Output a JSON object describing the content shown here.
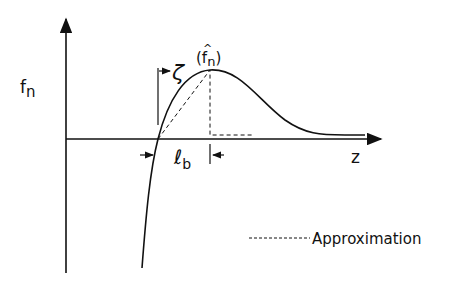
{
  "diagram": {
    "y_axis_label": "f",
    "y_axis_sub": "n",
    "x_axis_label": "z",
    "peak_label_open": "(",
    "peak_label_f": "f",
    "peak_label_sub": "n",
    "peak_label_close": ")",
    "peak_hat": "^",
    "zeta_label": "ζ",
    "lb_label": "ℓ",
    "lb_sub": "b",
    "legend_label": "Approximation",
    "colors": {
      "line": "#111111",
      "background": "#ffffff"
    }
  }
}
